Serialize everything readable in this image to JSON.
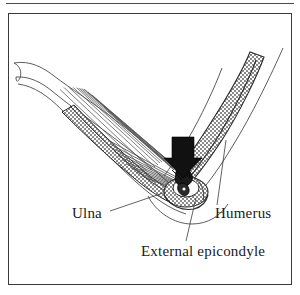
{
  "figure": {
    "name": "elbow-lateral-epicondyle-injury",
    "kind": "anatomical-line-illustration",
    "background_color": "#ffffff",
    "ink_color": "#1a1a1a",
    "frame_color": "#3b3b3b",
    "stipple_color": "#6d6d6d"
  },
  "labels": {
    "ulna": "Ulna",
    "humerus": "Humerus",
    "epicondyle": "External epicondyle"
  },
  "icons": {
    "force_arrow": "down-arrow-icon"
  },
  "annotations": {
    "arrow_direction": "down",
    "arrow_color": "#111111",
    "leader_lines": 3
  },
  "structures": [
    {
      "name": "humerus",
      "fill": "stipple",
      "label": "Humerus"
    },
    {
      "name": "ulna",
      "fill": "stipple",
      "label": "Ulna"
    },
    {
      "name": "external-epicondyle",
      "fill": "dark-detail",
      "label": "External epicondyle"
    },
    {
      "name": "extensor-muscle-fibers",
      "fill": "hatch",
      "label": ""
    },
    {
      "name": "skin-contour",
      "fill": "none",
      "label": ""
    }
  ]
}
